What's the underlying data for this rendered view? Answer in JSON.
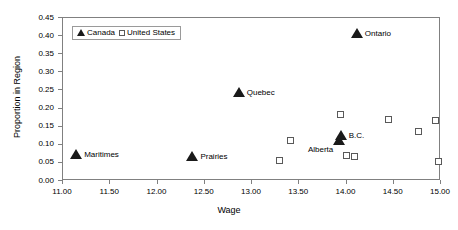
{
  "chart_data": {
    "type": "scatter",
    "title": "",
    "xlabel": "Wage",
    "ylabel": "Proportion in Region",
    "xlim": [
      11.0,
      15.0
    ],
    "ylim": [
      0.0,
      0.45
    ],
    "xticks": [
      "11.00",
      "11.50",
      "12.00",
      "12.50",
      "13.00",
      "13.50",
      "14.00",
      "14.50",
      "15.00"
    ],
    "yticks": [
      "0.00",
      "0.05",
      "0.10",
      "0.15",
      "0.20",
      "0.25",
      "0.30",
      "0.35",
      "0.40",
      "0.45"
    ],
    "xtick_values": [
      11.0,
      11.5,
      12.0,
      12.5,
      13.0,
      13.5,
      14.0,
      14.5,
      15.0
    ],
    "ytick_values": [
      0.0,
      0.05,
      0.1,
      0.15,
      0.2,
      0.25,
      0.3,
      0.35,
      0.4,
      0.45
    ],
    "grid": false,
    "legend_position": "top-left-inside",
    "series": [
      {
        "name": "Canada",
        "marker": "filled-triangle",
        "color": "#1a1a1a",
        "points": [
          {
            "label": "Maritimes",
            "x": 11.15,
            "y": 0.067,
            "label_pos": "right"
          },
          {
            "label": "Prairies",
            "x": 12.38,
            "y": 0.06,
            "label_pos": "right"
          },
          {
            "label": "Quebec",
            "x": 12.87,
            "y": 0.237,
            "label_pos": "right"
          },
          {
            "label": "Alberta",
            "x": 13.93,
            "y": 0.105,
            "label_pos": "left-below"
          },
          {
            "label": "B.C.",
            "x": 13.95,
            "y": 0.12,
            "label_pos": "right"
          },
          {
            "label": "Ontario",
            "x": 14.12,
            "y": 0.4,
            "label_pos": "right"
          }
        ]
      },
      {
        "name": "United States",
        "marker": "open-square",
        "color": "#595959",
        "points": [
          {
            "label": "",
            "x": 13.3,
            "y": 0.055
          },
          {
            "label": "",
            "x": 13.42,
            "y": 0.11
          },
          {
            "label": "",
            "x": 13.95,
            "y": 0.18
          },
          {
            "label": "",
            "x": 14.01,
            "y": 0.067
          },
          {
            "label": "",
            "x": 14.1,
            "y": 0.065
          },
          {
            "label": "",
            "x": 14.45,
            "y": 0.166
          },
          {
            "label": "",
            "x": 14.77,
            "y": 0.134
          },
          {
            "label": "",
            "x": 14.95,
            "y": 0.164
          },
          {
            "label": "",
            "x": 14.98,
            "y": 0.05
          }
        ]
      }
    ]
  },
  "legend": {
    "canada_label": "Canada",
    "us_label": "United States"
  },
  "axes": {
    "x_title": "Wage",
    "y_title": "Proportion in Region"
  }
}
